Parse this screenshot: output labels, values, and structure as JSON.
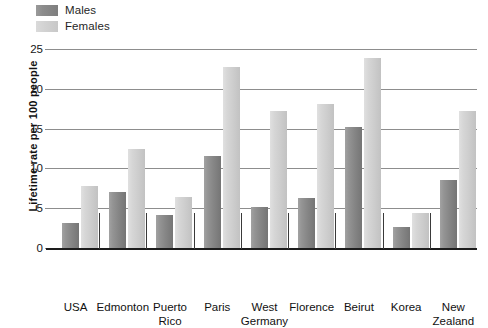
{
  "legend": {
    "entries": [
      {
        "label": "Males",
        "key": "males",
        "color": "#8a8a8a"
      },
      {
        "label": "Females",
        "key": "females",
        "color": "#d2d2d2"
      }
    ]
  },
  "axes": {
    "y_title": "Lifetime rate per 100 people",
    "y_ticks": [
      "0",
      "5",
      "10",
      "15",
      "20",
      "25"
    ]
  },
  "bottom_caption": "",
  "chart_data": {
    "type": "bar",
    "title": "",
    "subtitle": "",
    "xlabel": "",
    "ylabel": "Lifetime rate per 100 people",
    "ylim": [
      0,
      25
    ],
    "ytick_step": 5,
    "grid": true,
    "legend_position": "top-left",
    "grouping": "grouped",
    "categories": [
      "USA",
      "Edmonton",
      "Puerto\nRico",
      "Paris",
      "West\nGermany",
      "Florence",
      "Beirut",
      "Korea",
      "New\nZealand"
    ],
    "series": [
      {
        "name": "Males",
        "color": "#8a8a8a",
        "values": [
          3.2,
          7.0,
          4.1,
          11.5,
          5.2,
          6.3,
          15.2,
          2.6,
          8.5
        ]
      },
      {
        "name": "Females",
        "color": "#d2d2d2",
        "values": [
          7.8,
          12.4,
          6.4,
          22.7,
          17.2,
          18.1,
          23.9,
          4.4,
          17.2
        ]
      }
    ]
  }
}
